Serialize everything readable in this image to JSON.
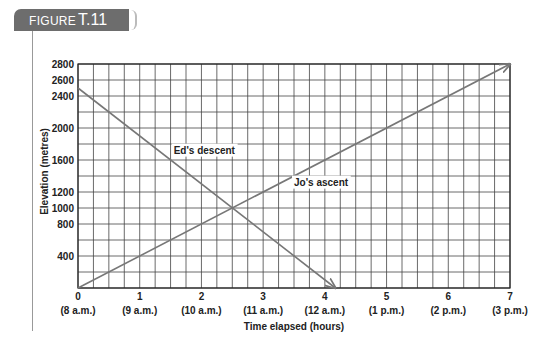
{
  "figure": {
    "label_prefix": "FIGURE",
    "label_number": "T.11",
    "tab_color": "#6d6d6d"
  },
  "chart_data": {
    "type": "line",
    "title": "",
    "xlabel": "Time elapsed (hours)",
    "ylabel": "Elevation (metres)",
    "xlim": [
      0,
      7
    ],
    "ylim": [
      0,
      2800
    ],
    "grid": true,
    "grid_x_step": 0.25,
    "grid_y_step": 200,
    "x_ticks": [
      0,
      1,
      2,
      3,
      4,
      5,
      6,
      7
    ],
    "x_tick_sublabels": [
      "(8 a.m.)",
      "(9 a.m.)",
      "(10 a.m.)",
      "(11 a.m.)",
      "(12 a.m.)",
      "(1 p.m.)",
      "(2 p.m.)",
      "(3 p.m.)"
    ],
    "y_ticks": [
      400,
      800,
      1000,
      1200,
      1600,
      2000,
      2400,
      2600,
      2800
    ],
    "y_zero_label": "0",
    "series": [
      {
        "name": "Ed's descent",
        "x": [
          0,
          4.17
        ],
        "y": [
          2500,
          0
        ],
        "color": "#777777",
        "arrow_end": true,
        "label_pos": [
          1.55,
          1680
        ]
      },
      {
        "name": "Jo's ascent",
        "x": [
          0,
          7
        ],
        "y": [
          0,
          2800
        ],
        "color": "#777777",
        "arrow_end": true,
        "label_pos": [
          3.5,
          1280
        ]
      }
    ],
    "intersection": {
      "x": 2.5,
      "y": 1000
    }
  }
}
